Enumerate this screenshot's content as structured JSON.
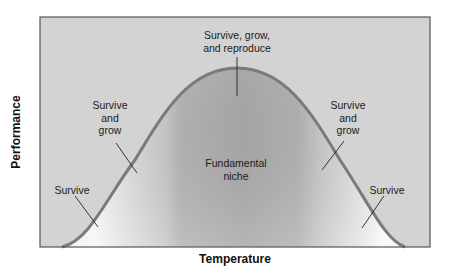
{
  "diagram": {
    "x_axis_label": "Temperature",
    "y_axis_label": "Performance",
    "regions": [
      {
        "id": "left-survive",
        "label": "Survive"
      },
      {
        "id": "left-survive-grow",
        "label": "Survive\nand\ngrow"
      },
      {
        "id": "peak",
        "label": "Survive, grow,\nand reproduce"
      },
      {
        "id": "center",
        "label": "Fundamental\nniche"
      },
      {
        "id": "right-survive-grow",
        "label": "Survive\nand\ngrow"
      },
      {
        "id": "right-survive",
        "label": "Survive"
      }
    ],
    "colors": {
      "background": "#d3d3d3",
      "curve_fill_dark": "#a9a9a9",
      "curve_fill_light": "#ffffff",
      "curve_stroke": "#7a7a7a",
      "frame": "#555555",
      "leader_line": "#222222"
    }
  }
}
